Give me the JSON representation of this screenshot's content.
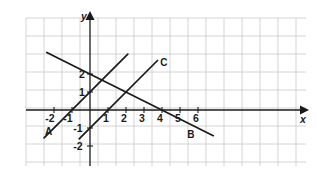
{
  "figure": {
    "kind": "cartesian-line-graph",
    "background_color": "#ffffff",
    "grid_color": "#c9c9c9",
    "axis_color": "#1a1a1a",
    "line_color": "#1a1a1a",
    "axis_names": {
      "x": "x",
      "y": "y"
    },
    "x_tick_labels": [
      "-2",
      "-1",
      "1",
      "2",
      "3",
      "4",
      "5",
      "6"
    ],
    "y_tick_labels": [
      "2",
      "1",
      "-1",
      "-2"
    ],
    "line_labels": [
      "A",
      "B",
      "C"
    ]
  },
  "chart_data": {
    "type": "line",
    "title": "",
    "xlabel": "x",
    "ylabel": "y",
    "xlim": [
      -2.6,
      6.9
    ],
    "ylim": [
      -2.5,
      3.1
    ],
    "grid": true,
    "grid_step": 1,
    "legend": "inline-endpoint-labels",
    "series": [
      {
        "name": "A",
        "label": "A",
        "equation": "y = x + 1",
        "slope": 1,
        "intercept": 1,
        "x_start": -2.55,
        "x_end": 2.1,
        "label_x": -2.3,
        "label_y": -1.15
      },
      {
        "name": "B",
        "label": "B",
        "equation": "y = -0.5x + 2",
        "slope": -0.5,
        "intercept": 2,
        "x_start": -2.4,
        "x_end": 6.85,
        "label_x": 5.6,
        "label_y": -1.35
      },
      {
        "name": "C",
        "label": "C",
        "equation": "y = x - 1",
        "slope": 1,
        "intercept": -1,
        "x_start": -0.6,
        "x_end": 3.75,
        "label_x": 4.1,
        "label_y": 2.65
      }
    ],
    "intersections": [
      {
        "lines": [
          "A",
          "B"
        ],
        "x": 0.667,
        "y": 1.667
      },
      {
        "lines": [
          "B",
          "C"
        ],
        "x": 2,
        "y": 1
      },
      {
        "lines": [
          "A",
          "C"
        ],
        "x": null,
        "y": null
      }
    ]
  },
  "x_ticks": [
    {
      "value": -2,
      "label": "-2",
      "px": 54,
      "label_x": 50,
      "label_y": 122
    },
    {
      "value": -1,
      "label": "-1",
      "px": 72,
      "label_x": 68,
      "label_y": 122
    },
    {
      "value": 1,
      "label": "1",
      "px": 108,
      "label_x": 106,
      "label_y": 122
    },
    {
      "value": 2,
      "label": "2",
      "px": 126,
      "label_x": 124,
      "label_y": 122
    },
    {
      "value": 3,
      "label": "3",
      "px": 144,
      "label_x": 142,
      "label_y": 122
    },
    {
      "value": 4,
      "label": "4",
      "px": 162,
      "label_x": 160,
      "label_y": 122
    },
    {
      "value": 5,
      "label": "5",
      "px": 180,
      "label_x": 178,
      "label_y": 122
    },
    {
      "value": 6,
      "label": "6",
      "px": 198,
      "label_x": 196,
      "label_y": 122
    }
  ],
  "y_ticks": [
    {
      "value": 2,
      "label": "2",
      "py": 74,
      "label_x": 82,
      "label_y": 78
    },
    {
      "value": 1,
      "label": "1",
      "py": 92,
      "label_x": 82,
      "label_y": 96
    },
    {
      "value": -1,
      "label": "-1",
      "py": 128,
      "label_x": 78,
      "label_y": 132
    },
    {
      "value": -2,
      "label": "-2",
      "py": 146,
      "label_x": 78,
      "label_y": 150
    }
  ]
}
